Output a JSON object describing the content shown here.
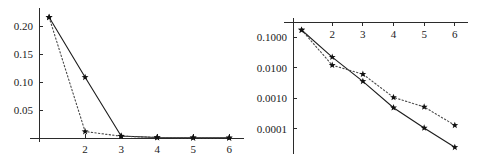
{
  "figure": {
    "background": "#ffffff",
    "panel_count": 2
  },
  "chart_data": [
    {
      "id": "left-panel",
      "type": "line",
      "scale": "linear",
      "title": "",
      "subtitle": "",
      "xlabel": "",
      "ylabel": "",
      "grid": false,
      "legend": null,
      "x": [
        1,
        2,
        3,
        4,
        5,
        6
      ],
      "xlim": [
        0.72,
        6.3
      ],
      "ylim": [
        0,
        0.225
      ],
      "xtick_labels": [
        "2",
        "3",
        "4",
        "5",
        "6"
      ],
      "xtick_values": [
        2,
        3,
        4,
        5,
        6
      ],
      "ytick_labels": [
        "0.05",
        "0.10",
        "0.15",
        "0.20"
      ],
      "ytick_values": [
        0.05,
        0.1,
        0.15,
        0.2
      ],
      "axis_position": {
        "x_axis": "bottom",
        "y_axis": "left"
      },
      "marker": "star",
      "series": [
        {
          "name": "solid",
          "style": "solid",
          "values": [
            0.2155,
            0.1085,
            0.0035,
            0.0008,
            0.0003,
            0.0002
          ]
        },
        {
          "name": "dotted",
          "style": "dotted",
          "values": [
            0.2155,
            0.0115,
            0.0032,
            0.001,
            0.0005,
            0.0003
          ]
        }
      ]
    },
    {
      "id": "right-panel",
      "type": "line",
      "scale": "log",
      "title": "",
      "subtitle": "",
      "xlabel": "",
      "ylabel": "",
      "grid": false,
      "legend": null,
      "x": [
        1,
        2,
        3,
        4,
        5,
        6
      ],
      "xlim": [
        0.72,
        6.3
      ],
      "ylim": [
        2e-05,
        0.32
      ],
      "xtick_labels": [
        "2",
        "3",
        "4",
        "5",
        "6"
      ],
      "xtick_values": [
        2,
        3,
        4,
        5,
        6
      ],
      "ytick_labels": [
        "0.1000",
        "0.0100",
        "0.0010",
        "0.0001"
      ],
      "ytick_values": [
        0.1,
        0.01,
        0.001,
        0.0001
      ],
      "axis_position": {
        "x_axis": "top",
        "y_axis": "left"
      },
      "marker": "star",
      "series": [
        {
          "name": "solid",
          "style": "solid",
          "values": [
            0.175,
            0.0225,
            0.0036,
            0.00049,
            0.000106,
            2.45e-05
          ]
        },
        {
          "name": "dotted",
          "style": "dotted",
          "values": [
            0.175,
            0.0122,
            0.0062,
            0.00107,
            0.00052,
            0.00013
          ]
        }
      ]
    }
  ]
}
